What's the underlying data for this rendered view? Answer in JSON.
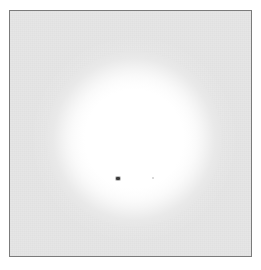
{
  "figure": {
    "width_px": 261,
    "height_px": 270,
    "page_background": "#ffffff"
  },
  "panel": {
    "name": "image-panel",
    "left_px": 9,
    "top_px": 10,
    "width_px": 243,
    "height_px": 247,
    "background_color": "#e6e6e6",
    "border_color": "#7b7b7b",
    "border_width_px": 1
  },
  "chart_data": {
    "type": "heatmap",
    "title": "",
    "subtitle": "",
    "xlabel": "",
    "ylabel": "",
    "grid": false,
    "legend": null,
    "colormap": "grayscale",
    "background_level": "#e6e6e6",
    "peak_level": "#ffffff",
    "features": [
      {
        "name": "diffuse-glow",
        "shape": "circle",
        "center_x_px": 133,
        "center_y_px": 138,
        "saturated_radius_px": 56,
        "falloff_radius_px": 88,
        "core_color": "#ffffff",
        "edge_color": "#e6e6e6"
      },
      {
        "name": "outer-skirt",
        "shape": "circle",
        "center_x_px": 133,
        "center_y_px": 138,
        "radius_px": 104,
        "peak_opacity": 0.55
      },
      {
        "name": "center-marker",
        "shape": "rect",
        "center_x_px": 117,
        "center_y_px": 177,
        "width_px": 4,
        "height_px": 3,
        "color": "#3a3a3a"
      },
      {
        "name": "faint-speck",
        "shape": "dot",
        "center_x_px": 152,
        "center_y_px": 177,
        "radius_px": 1,
        "color": "#cdcdcd"
      }
    ]
  }
}
